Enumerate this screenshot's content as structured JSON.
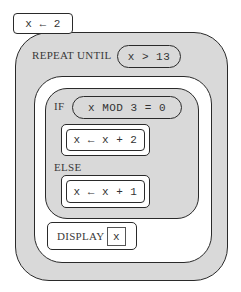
{
  "diagram": {
    "type": "block-based pseudocode",
    "init": {
      "text": "x ← 2"
    },
    "repeat": {
      "keyword": "REPEAT UNTIL",
      "condition": "x > 13",
      "body": {
        "if_block": {
          "keyword": "IF",
          "condition": "x MOD 3 = 0",
          "then_statement": "x ← x + 2",
          "else_keyword": "ELSE",
          "else_statement": "x ← x + 1"
        },
        "display": {
          "keyword": "DISPLAY",
          "argument": "x"
        }
      }
    }
  },
  "colors": {
    "block_fill": "#d9d9d9",
    "statement_fill": "#ffffff",
    "outline": "#2a2a2a"
  }
}
